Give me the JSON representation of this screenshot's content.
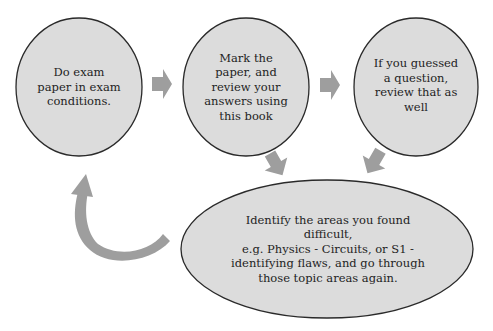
{
  "diagram": {
    "type": "cycle-flow",
    "colors": {
      "node_fill": "#dcdcdc",
      "node_stroke": "#2a2a2a",
      "arrow_fill": "#9e9e9e",
      "text": "#1e1e1e",
      "background": "#ffffff"
    },
    "nodes": [
      {
        "id": "step-1",
        "shape": "circle",
        "text": "Do exam paper in exam conditions.",
        "lines": [
          "Do exam",
          "paper in exam",
          "conditions."
        ]
      },
      {
        "id": "step-2",
        "shape": "circle",
        "text": "Mark the paper, and review your answers using this book",
        "lines": [
          "Mark the",
          "paper, and",
          "review your",
          "answers using",
          "this book"
        ]
      },
      {
        "id": "step-3",
        "shape": "circle",
        "text": "If you guessed a question, review that as well",
        "lines": [
          "If you guessed",
          "a question,",
          "review that as",
          "well"
        ]
      },
      {
        "id": "step-4",
        "shape": "ellipse",
        "text": "Identify the areas you found difficult, e.g. Physics - Circuits, or S1 - identifying flaws, and go through those topic areas again.",
        "lines": [
          "Identify the areas you found difficult,",
          "e.g. Physics - Circuits, or S1 -",
          "identifying flaws, and go through",
          "those topic areas again."
        ]
      }
    ],
    "edges": [
      {
        "from": "step-1",
        "to": "step-2",
        "style": "block-arrow-right"
      },
      {
        "from": "step-2",
        "to": "step-3",
        "style": "block-arrow-right"
      },
      {
        "from": "step-2",
        "to": "step-4",
        "style": "block-arrow-down"
      },
      {
        "from": "step-3",
        "to": "step-4",
        "style": "block-arrow-down-left"
      },
      {
        "from": "step-4",
        "to": "step-1",
        "style": "curved-arrow"
      }
    ]
  }
}
